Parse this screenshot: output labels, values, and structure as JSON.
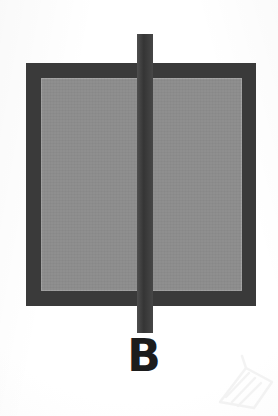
{
  "figure": {
    "domain": "scanned-technical-figure",
    "label": "B",
    "background_color": "#fdfdfd",
    "shapes": {
      "rectangle": {
        "name": "bordered-rectangle",
        "x": 26,
        "y": 63,
        "width": 230,
        "height": 243,
        "border_thickness": 15,
        "border_color": "#3a3a3a",
        "fill_color": "#8c8c8c",
        "inner_hairline_color": "#a2a2a2"
      },
      "vertical_line": {
        "name": "vertical-divider-stem",
        "x": 137,
        "y": 34,
        "width": 16,
        "height": 299,
        "color": "#3b3b3b",
        "extends_above_rectangle": true,
        "extends_below_rectangle": true
      },
      "watermark": {
        "name": "corner-watermark",
        "color": "#ececec",
        "position": "bottom-right"
      }
    },
    "label_style": {
      "color": "#1c1c1c",
      "font_size_px": 44,
      "weight": "bold",
      "center_x": 144,
      "top_y": 334
    }
  }
}
